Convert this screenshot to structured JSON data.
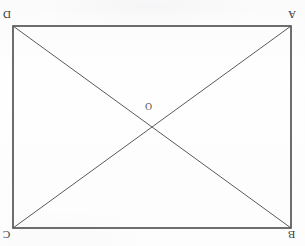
{
  "figure": {
    "type": "geometry-diagram",
    "shape": "rectangle-with-diagonals",
    "orientation": "upside-down-scan",
    "background_color": "#fdfdfd",
    "stroke_color": "#4a4a4a",
    "diagonal_color": "#5a5a5a",
    "rectangle": {
      "left": 13,
      "top": 26,
      "right": 291,
      "bottom": 228,
      "width": 278,
      "height": 202,
      "border_width": 1.6
    },
    "diagonals": {
      "count": 2,
      "width": 1.0,
      "segments": [
        {
          "name": "diagonal-D-B",
          "x1": 13,
          "y1": 26,
          "x2": 291,
          "y2": 228
        },
        {
          "name": "diagonal-A-C",
          "x1": 291,
          "y1": 26,
          "x2": 13,
          "y2": 228
        }
      ]
    },
    "intersection": {
      "x": 152,
      "y": 127
    },
    "vertices": [
      {
        "id": "D",
        "label": "D",
        "position": "top-left",
        "x": 13,
        "y": 26
      },
      {
        "id": "A",
        "label": "A",
        "position": "top-right",
        "x": 291,
        "y": 26
      },
      {
        "id": "C",
        "label": "C",
        "position": "bottom-left",
        "x": 13,
        "y": 228
      },
      {
        "id": "B",
        "label": "B",
        "position": "bottom-right",
        "x": 291,
        "y": 228
      }
    ],
    "center": {
      "id": "O",
      "label": "O",
      "x": 152,
      "y": 127
    }
  }
}
